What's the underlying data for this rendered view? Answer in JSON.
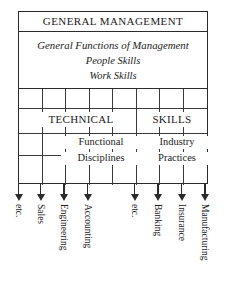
{
  "diagram": {
    "header": {
      "title": "GENERAL MANAGEMENT"
    },
    "functions_block": {
      "lines": [
        "General Functions of Management",
        "People Skills",
        "Work Skills"
      ]
    },
    "skill_bands": [
      {
        "label": "TECHNICAL"
      },
      {
        "label": "SKILLS"
      }
    ],
    "sub_groups": [
      {
        "line1": "Functional",
        "line2": "Disciplines"
      },
      {
        "line1": "Industry",
        "line2": "Practices"
      }
    ],
    "columns": [
      {
        "label": "etc.",
        "arrow": "down-arrow-icon"
      },
      {
        "label": "Sales",
        "arrow": "down-arrow-icon"
      },
      {
        "label": "Engineering",
        "arrow": "down-arrow-icon"
      },
      {
        "label": "Accounting",
        "arrow": "down-arrow-icon"
      },
      {
        "label": "etc.",
        "arrow": "down-arrow-icon"
      },
      {
        "label": "Banking",
        "arrow": "down-arrow-icon"
      },
      {
        "label": "Insurance",
        "arrow": "down-arrow-icon"
      },
      {
        "label": "Manufacturing",
        "arrow": "down-arrow-icon"
      }
    ],
    "colors": {
      "line": "#2b2b2b",
      "grid_line": "#3a3a3a",
      "text": "#1a1a1a",
      "background": "#ffffff"
    }
  }
}
